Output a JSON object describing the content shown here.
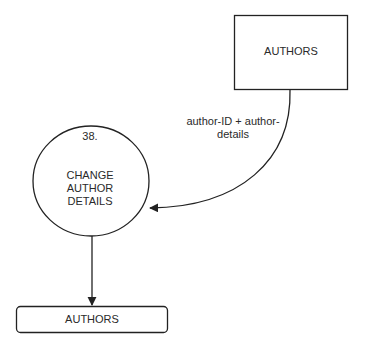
{
  "diagram": {
    "type": "data-flow-diagram",
    "external_entity": {
      "label": "AUTHORS"
    },
    "process": {
      "number": "38.",
      "label_lines": [
        "CHANGE",
        "AUTHOR",
        "DETAILS"
      ]
    },
    "data_store": {
      "label": "AUTHORS"
    },
    "flows": [
      {
        "from": "external_entity",
        "to": "process",
        "label_lines": [
          "author-ID + author-",
          "details"
        ]
      },
      {
        "from": "process",
        "to": "data_store",
        "label": ""
      }
    ],
    "colors": {
      "stroke": "#222222",
      "background": "#ffffff",
      "text": "#2a2a2a"
    }
  }
}
